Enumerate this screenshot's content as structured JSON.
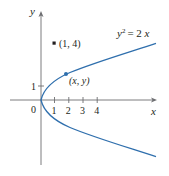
{
  "figure": {
    "equation_label": "y² = 2x",
    "equation_parts": {
      "lhs_base": "y",
      "lhs_exp": "2",
      "rhs": "= 2x"
    },
    "x_axis_label": "x",
    "y_axis_label": "y",
    "origin_label": "0",
    "x_ticks": [
      "1",
      "2",
      "3",
      "4"
    ],
    "y_ticks": [
      "1"
    ],
    "point_fixed_label": "(1, 4)",
    "point_on_curve_label": "(x, y)",
    "colors": {
      "curve": "#2f6fad",
      "axes": "#6d6e71",
      "text": "#231f20",
      "point": "#231f20"
    }
  },
  "chart_data": {
    "type": "line",
    "title": "",
    "curve": "y^2 = 2x",
    "xlabel": "x",
    "ylabel": "y",
    "x_ticks": [
      1,
      2,
      3,
      4
    ],
    "y_ticks": [
      1
    ],
    "xlim": [
      -2,
      8
    ],
    "ylim": [
      -4.5,
      6
    ],
    "points": [
      {
        "label": "(1, 4)",
        "x": 1,
        "y": 4
      },
      {
        "label": "(x, y)",
        "x": 1.8,
        "y": 1.9
      }
    ],
    "grid": false
  }
}
